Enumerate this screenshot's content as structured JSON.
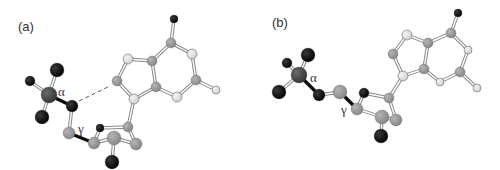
{
  "figure": {
    "colors": {
      "phosphorus": "#4a4a4a",
      "oxygen": "#0a0a0a",
      "carbon": "#9a9a9a",
      "nitrogen": "#e2e2e2",
      "bond": "#888888",
      "bond_highlight": "#0a0a0a",
      "hbond": "#555555"
    },
    "panels": [
      {
        "label": "(a)",
        "label_pos": [
          18,
          31
        ],
        "angle_labels": [
          {
            "text": "α",
            "x": 58,
            "y": 96
          },
          {
            "text": "γ",
            "x": 78,
            "y": 133
          }
        ],
        "atoms": [
          {
            "id": "O1P",
            "type": "oxygen",
            "x": 57,
            "y": 70,
            "r": 7
          },
          {
            "id": "O2P",
            "type": "oxygen",
            "x": 30,
            "y": 81,
            "r": 5
          },
          {
            "id": "O3P",
            "type": "oxygen",
            "x": 42,
            "y": 117,
            "r": 7
          },
          {
            "id": "P",
            "type": "phosphorus",
            "x": 49,
            "y": 95,
            "r": 8
          },
          {
            "id": "O5'",
            "type": "oxygen",
            "x": 72,
            "y": 106,
            "r": 6
          },
          {
            "id": "C5'",
            "type": "carbon",
            "x": 69,
            "y": 133,
            "r": 6
          },
          {
            "id": "O4'",
            "type": "oxygen",
            "x": 100,
            "y": 128,
            "r": 4
          },
          {
            "id": "C1'",
            "type": "carbon",
            "x": 128,
            "y": 127,
            "r": 5
          },
          {
            "id": "C2'",
            "type": "carbon",
            "x": 136,
            "y": 144,
            "r": 6
          },
          {
            "id": "C4'",
            "type": "carbon",
            "x": 94,
            "y": 143,
            "r": 6
          },
          {
            "id": "C3'",
            "type": "carbon",
            "x": 114,
            "y": 138,
            "r": 7
          },
          {
            "id": "O3'",
            "type": "oxygen",
            "x": 112,
            "y": 162,
            "r": 7
          },
          {
            "id": "N9",
            "type": "nitrogen",
            "x": 134,
            "y": 99,
            "r": 5
          },
          {
            "id": "C8",
            "type": "carbon",
            "x": 117,
            "y": 81,
            "r": 5
          },
          {
            "id": "N7",
            "type": "nitrogen",
            "x": 128,
            "y": 59,
            "r": 5
          },
          {
            "id": "C5",
            "type": "carbon",
            "x": 152,
            "y": 61,
            "r": 5
          },
          {
            "id": "C4",
            "type": "carbon",
            "x": 156,
            "y": 87,
            "r": 5
          },
          {
            "id": "N3",
            "type": "nitrogen",
            "x": 177,
            "y": 97,
            "r": 5
          },
          {
            "id": "C2",
            "type": "carbon",
            "x": 196,
            "y": 80,
            "r": 5
          },
          {
            "id": "N1",
            "type": "nitrogen",
            "x": 192,
            "y": 54,
            "r": 5
          },
          {
            "id": "C6",
            "type": "carbon",
            "x": 171,
            "y": 43,
            "r": 5
          },
          {
            "id": "O6",
            "type": "oxygen",
            "x": 174,
            "y": 19,
            "r": 4
          },
          {
            "id": "N2",
            "type": "nitrogen",
            "x": 216,
            "y": 90,
            "r": 4
          }
        ],
        "bonds": [
          [
            "P",
            "O1P",
            "normal"
          ],
          [
            "P",
            "O2P",
            "normal"
          ],
          [
            "P",
            "O3P",
            "normal"
          ],
          [
            "P",
            "O5'",
            "highlight"
          ],
          [
            "O5'",
            "C5'",
            "normal"
          ],
          [
            "C5'",
            "C4'",
            "highlight"
          ],
          [
            "C4'",
            "O4'",
            "normal"
          ],
          [
            "O4'",
            "C1'",
            "normal"
          ],
          [
            "C1'",
            "C2'",
            "normal"
          ],
          [
            "C2'",
            "C3'",
            "normal"
          ],
          [
            "C3'",
            "C4'",
            "normal"
          ],
          [
            "C3'",
            "O3'",
            "normal"
          ],
          [
            "C1'",
            "N9",
            "normal"
          ],
          [
            "N9",
            "C8",
            "normal"
          ],
          [
            "C8",
            "N7",
            "normal"
          ],
          [
            "N7",
            "C5",
            "normal"
          ],
          [
            "C5",
            "C4",
            "normal"
          ],
          [
            "C4",
            "N9",
            "normal"
          ],
          [
            "C4",
            "N3",
            "normal"
          ],
          [
            "N3",
            "C2",
            "normal"
          ],
          [
            "C2",
            "N1",
            "normal"
          ],
          [
            "N1",
            "C6",
            "normal"
          ],
          [
            "C6",
            "C5",
            "normal"
          ],
          [
            "C6",
            "O6",
            "normal"
          ],
          [
            "C2",
            "N2",
            "normal"
          ]
        ],
        "hbond": {
          "from": [
            79,
            101
          ],
          "to": [
            110,
            86
          ]
        }
      },
      {
        "label": "(b)",
        "label_pos": [
          272,
          27
        ],
        "angle_labels": [
          {
            "text": "α",
            "x": 310,
            "y": 82
          },
          {
            "text": "γ",
            "x": 341,
            "y": 114
          }
        ],
        "atoms": [
          {
            "id": "O1P",
            "type": "oxygen",
            "x": 308,
            "y": 55,
            "r": 7
          },
          {
            "id": "O2P",
            "type": "oxygen",
            "x": 287,
            "y": 63,
            "r": 5
          },
          {
            "id": "O3P",
            "type": "oxygen",
            "x": 279,
            "y": 92,
            "r": 7
          },
          {
            "id": "P",
            "type": "phosphorus",
            "x": 299,
            "y": 75,
            "r": 8
          },
          {
            "id": "O5'",
            "type": "oxygen",
            "x": 319,
            "y": 95,
            "r": 6
          },
          {
            "id": "C5'",
            "type": "carbon",
            "x": 340,
            "y": 92,
            "r": 7
          },
          {
            "id": "O4'",
            "type": "oxygen",
            "x": 364,
            "y": 93,
            "r": 5
          },
          {
            "id": "C1'",
            "type": "carbon",
            "x": 389,
            "y": 98,
            "r": 5
          },
          {
            "id": "C2'",
            "type": "carbon",
            "x": 396,
            "y": 120,
            "r": 6
          },
          {
            "id": "C4'",
            "type": "carbon",
            "x": 357,
            "y": 109,
            "r": 6
          },
          {
            "id": "C3'",
            "type": "carbon",
            "x": 382,
            "y": 117,
            "r": 7
          },
          {
            "id": "O3'",
            "type": "oxygen",
            "x": 381,
            "y": 136,
            "r": 7
          },
          {
            "id": "N9",
            "type": "nitrogen",
            "x": 403,
            "y": 76,
            "r": 5
          },
          {
            "id": "C8",
            "type": "carbon",
            "x": 393,
            "y": 54,
            "r": 5
          },
          {
            "id": "N7",
            "type": "nitrogen",
            "x": 407,
            "y": 35,
            "r": 5
          },
          {
            "id": "C5",
            "type": "carbon",
            "x": 428,
            "y": 43,
            "r": 5
          },
          {
            "id": "C4",
            "type": "carbon",
            "x": 424,
            "y": 69,
            "r": 5
          },
          {
            "id": "N3",
            "type": "nitrogen",
            "x": 440,
            "y": 82,
            "r": 4
          },
          {
            "id": "C2",
            "type": "carbon",
            "x": 460,
            "y": 72,
            "r": 5
          },
          {
            "id": "N1",
            "type": "nitrogen",
            "x": 468,
            "y": 50,
            "r": 4
          },
          {
            "id": "C6",
            "type": "carbon",
            "x": 451,
            "y": 33,
            "r": 5
          },
          {
            "id": "O6",
            "type": "oxygen",
            "x": 458,
            "y": 13,
            "r": 4
          },
          {
            "id": "N2",
            "type": "nitrogen",
            "x": 477,
            "y": 88,
            "r": 4
          }
        ],
        "bonds": [
          [
            "P",
            "O1P",
            "normal"
          ],
          [
            "P",
            "O2P",
            "normal"
          ],
          [
            "P",
            "O3P",
            "normal"
          ],
          [
            "P",
            "O5'",
            "highlight"
          ],
          [
            "O5'",
            "C5'",
            "normal"
          ],
          [
            "C5'",
            "C4'",
            "highlight"
          ],
          [
            "C4'",
            "O4'",
            "normal"
          ],
          [
            "O4'",
            "C1'",
            "normal"
          ],
          [
            "C1'",
            "C2'",
            "normal"
          ],
          [
            "C2'",
            "C3'",
            "normal"
          ],
          [
            "C3'",
            "C4'",
            "normal"
          ],
          [
            "C3'",
            "O3'",
            "normal"
          ],
          [
            "C1'",
            "N9",
            "normal"
          ],
          [
            "N9",
            "C8",
            "normal"
          ],
          [
            "C8",
            "N7",
            "normal"
          ],
          [
            "N7",
            "C5",
            "normal"
          ],
          [
            "C5",
            "C4",
            "normal"
          ],
          [
            "C4",
            "N9",
            "normal"
          ],
          [
            "C4",
            "N3",
            "normal"
          ],
          [
            "N3",
            "C2",
            "normal"
          ],
          [
            "C2",
            "N1",
            "normal"
          ],
          [
            "N1",
            "C6",
            "normal"
          ],
          [
            "C6",
            "C5",
            "normal"
          ],
          [
            "C6",
            "O6",
            "normal"
          ],
          [
            "C2",
            "N2",
            "normal"
          ]
        ],
        "hbond": null
      }
    ]
  }
}
